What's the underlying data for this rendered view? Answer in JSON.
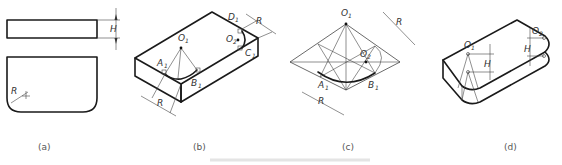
{
  "figure": {
    "panels": [
      {
        "id": "a",
        "caption": "(a)",
        "labels": {
          "height": "H",
          "radius": "R"
        }
      },
      {
        "id": "b",
        "caption": "(b)",
        "labels": {
          "o1": "O",
          "o1_sub": "1",
          "a1": "A",
          "a1_sub": "1",
          "b1": "B",
          "b1_sub": "1",
          "o2": "O",
          "o2_sub": "2",
          "c1": "C",
          "c1_sub": "1",
          "d1": "D",
          "d1_sub": "1",
          "r_top": "R",
          "r_bottom": "R"
        }
      },
      {
        "id": "c",
        "caption": "(c)",
        "labels": {
          "o1": "O",
          "o1_sub": "1",
          "o2": "O",
          "o2_sub": "2",
          "a1": "A",
          "a1_sub": "1",
          "b1": "B",
          "b1_sub": "1",
          "r_top": "R",
          "r_bottom": "R"
        }
      },
      {
        "id": "d",
        "caption": "(d)",
        "labels": {
          "o1": "O",
          "o1_sub": "1",
          "o2": "O",
          "o2_sub": "2",
          "h1": "H",
          "h2": "H"
        }
      }
    ],
    "colors": {
      "line": "#1a1a1a",
      "thin": "#444444",
      "background": "#ffffff"
    }
  }
}
